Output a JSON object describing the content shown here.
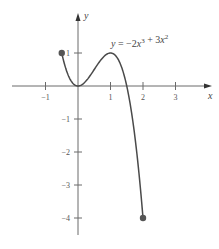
{
  "chart_data": {
    "type": "line",
    "title": "",
    "function": "y = -2x^3 + 3x^2",
    "annotation": {
      "text": "y = −2x³ + 3x²",
      "parts": [
        {
          "t": "y",
          "italic": true
        },
        {
          "t": " = −2",
          "italic": false
        },
        {
          "t": "x",
          "italic": true
        },
        {
          "t": "3",
          "sup": true
        },
        {
          "t": " + 3",
          "italic": false
        },
        {
          "t": "x",
          "italic": true
        },
        {
          "t": "2",
          "sup": true
        }
      ],
      "position": [
        1.0,
        1.35
      ]
    },
    "xlabel": "x",
    "ylabel": "y",
    "domain": [
      -0.5,
      2
    ],
    "xlim": [
      -2.05,
      4.1
    ],
    "ylim": [
      -4.5,
      2.2
    ],
    "x_ticks": [
      -1,
      1,
      2,
      3
    ],
    "x_tick_labels": [
      "−1",
      "1",
      "2",
      "3"
    ],
    "y_ticks": [
      1,
      -1,
      -2,
      -3,
      -4
    ],
    "y_tick_labels": [
      "1",
      "−1",
      "−2",
      "−3",
      "−4"
    ],
    "grid": false,
    "legend": null,
    "endpoints": [
      {
        "x": -0.5,
        "y": 1,
        "filled": true
      },
      {
        "x": 2,
        "y": -4,
        "filled": true
      }
    ],
    "key_points": [
      {
        "x": 0,
        "y": 0,
        "label": "local minimum"
      },
      {
        "x": 1,
        "y": 1,
        "label": "local maximum"
      },
      {
        "x": 1.5,
        "y": 0,
        "label": "x-intercept"
      }
    ],
    "x": [
      -0.5,
      -0.25,
      0,
      0.25,
      0.5,
      0.75,
      1,
      1.25,
      1.5,
      1.75,
      2
    ],
    "series": [
      {
        "name": "y = -2x^3 + 3x^2",
        "values": [
          1,
          0.219,
          0,
          0.156,
          0.5,
          0.844,
          1,
          0.781,
          0,
          -1.531,
          -4
        ]
      }
    ]
  },
  "layout": {
    "origin_px": [
      78,
      86
    ],
    "scale_x": 32.5,
    "scale_y": 33,
    "x_axis_px": [
      12,
      212
    ],
    "y_axis_px": [
      13,
      235
    ],
    "colors": {
      "axis": "#6a6a6a",
      "curve": "#4a4a4a",
      "point": "#555555",
      "text": "#444444"
    }
  }
}
